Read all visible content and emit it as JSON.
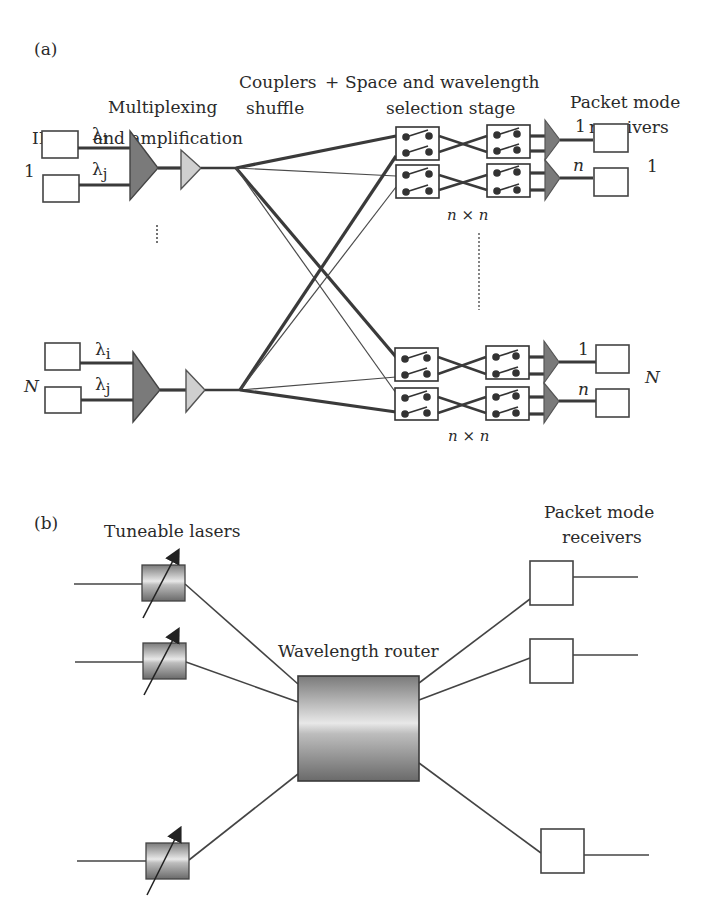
{
  "panel_a": {
    "tag": "(a)",
    "headers": {
      "ilms": "ILMs",
      "mux_line1": "Multiplexing",
      "mux_line2": "and amplification",
      "couplers_line1": "Couplers",
      "couplers_line2": "shuffle",
      "plus": "+",
      "space_line1": "Space and wavelength",
      "space_line2": "selection stage",
      "rx_line1": "Packet mode",
      "rx_line2": "receivers"
    },
    "groups": [
      {
        "index_label": "1",
        "lambda_i": "λ",
        "lambda_i_sub": "i",
        "lambda_j": "λ",
        "lambda_j_sub": "j",
        "size_label": "n × n",
        "out_top": "1",
        "out_bottom": "n",
        "rx_index": "1"
      },
      {
        "index_label": "N",
        "lambda_i": "λ",
        "lambda_i_sub": "i",
        "lambda_j": "λ",
        "lambda_j_sub": "j",
        "size_label": "n × n",
        "out_top": "1",
        "out_bottom": "n",
        "rx_index": "N"
      }
    ]
  },
  "panel_b": {
    "tag": "(b)",
    "lasers_label": "Tuneable lasers",
    "router_label": "Wavelength router",
    "rx_line1": "Packet mode",
    "rx_line2": "receivers"
  },
  "colors": {
    "amp_dark": "#7a7a7a",
    "amp_light": "#cfcfcf",
    "stroke": "#3a3a3a",
    "router_gradient_dark": "#6e6e6e",
    "router_gradient_light": "#e6e6e6"
  }
}
